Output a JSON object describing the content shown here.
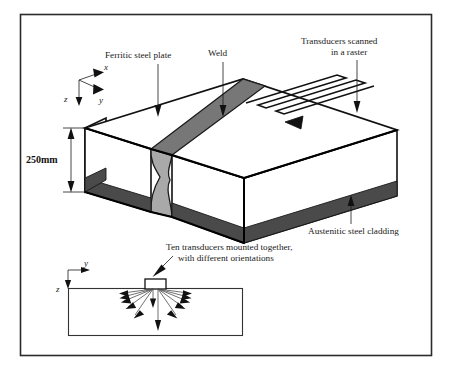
{
  "figure": {
    "frame_color": "#2b2b2b",
    "background": "#ffffff",
    "body_fill": "#ffffff",
    "weld_fill": "#a9a9a9",
    "cladding_fill": "#4a4a4a",
    "top_face_fill": "#ffffff",
    "line_color": "#111111"
  },
  "labels": {
    "ferritic_plate": "Ferritic steel plate",
    "weld": "Weld",
    "transducers_raster_line1": "Transducers scanned",
    "transducers_raster_line2": "in a raster",
    "cladding": "Austenitic steel cladding",
    "ten_transducers_line1": "Ten transducers mounted together,",
    "ten_transducers_line2": "with different orientations",
    "thickness": "250mm"
  },
  "axes": {
    "upper": {
      "x": "x",
      "y": "y",
      "z": "z"
    },
    "lower": {
      "y": "y",
      "z": "z"
    }
  },
  "geometry": {
    "plate_thickness_mm": 250,
    "beam_count": 10,
    "scan_pattern": "raster"
  }
}
